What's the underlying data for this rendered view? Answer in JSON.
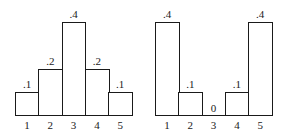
{
  "chart_data": [
    {
      "type": "bar",
      "title": "",
      "xlabel": "",
      "ylabel": "",
      "categories": [
        "1",
        "2",
        "3",
        "4",
        "5"
      ],
      "values": [
        0.1,
        0.2,
        0.4,
        0.2,
        0.1
      ],
      "value_labels": [
        ".1",
        ".2",
        ".4",
        ".2",
        ".1"
      ],
      "ylim": [
        0,
        0.4
      ],
      "grid": false,
      "legend": null
    },
    {
      "type": "bar",
      "title": "",
      "xlabel": "",
      "ylabel": "",
      "categories": [
        "1",
        "2",
        "3",
        "4",
        "5"
      ],
      "values": [
        0.4,
        0.1,
        0,
        0.1,
        0.4
      ],
      "value_labels": [
        ".4",
        ".1",
        "0",
        ".1",
        ".4"
      ],
      "ylim": [
        0,
        0.4
      ],
      "grid": false,
      "legend": null
    }
  ]
}
